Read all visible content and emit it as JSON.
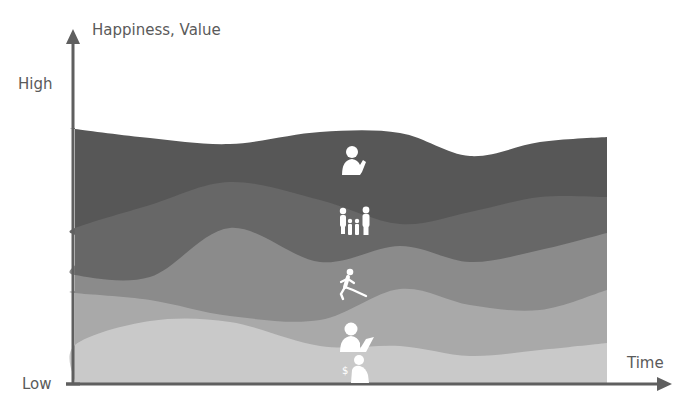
{
  "chart_data": {
    "type": "area",
    "subtype": "streamgraph",
    "title": "",
    "xlabel": "Time",
    "ylabel": "Happiness, Value",
    "y_ticks": [
      "Low",
      "High"
    ],
    "grid": false,
    "legend": "none (icons inside layers)",
    "x": [
      0,
      75,
      150,
      230,
      320,
      400,
      470,
      540,
      607
    ],
    "x_range_px": [
      75,
      607
    ],
    "y_range_note": "values = height above x-axis in px; 'High' ≈ 300",
    "series": [
      {
        "name": "Money",
        "icon": "person-with-money-icon",
        "color": "#c9c9c9",
        "top": [
          1,
          39,
          63,
          62,
          38,
          38,
          28,
          34,
          41
        ]
      },
      {
        "name": "Work",
        "icon": "person-with-laptop-icon",
        "color": "#a9a9a9",
        "top": [
          93,
          91,
          84,
          68,
          64,
          95,
          79,
          74,
          94
        ]
      },
      {
        "name": "Health",
        "icon": "running-person-icon",
        "color": "#8b8b8b",
        "top": [
          119,
          109,
          107,
          156,
          122,
          138,
          122,
          134,
          151
        ]
      },
      {
        "name": "Family",
        "icon": "family-icon",
        "color": "#676767",
        "top": [
          149,
          156,
          179,
          202,
          184,
          160,
          172,
          187,
          187
        ]
      },
      {
        "name": "Meaning / Spirituality",
        "icon": "praying-person-icon",
        "color": "#575757",
        "top": [
          256,
          255,
          246,
          240,
          252,
          251,
          228,
          242,
          247
        ]
      }
    ]
  },
  "labels": {
    "ylabel": "Happiness, Value",
    "high": "High",
    "low": "Low",
    "xlabel": "Time"
  },
  "colors": {
    "axis": "#5f5f5f",
    "text": "#5a5a5a",
    "icon": "#ffffff"
  }
}
